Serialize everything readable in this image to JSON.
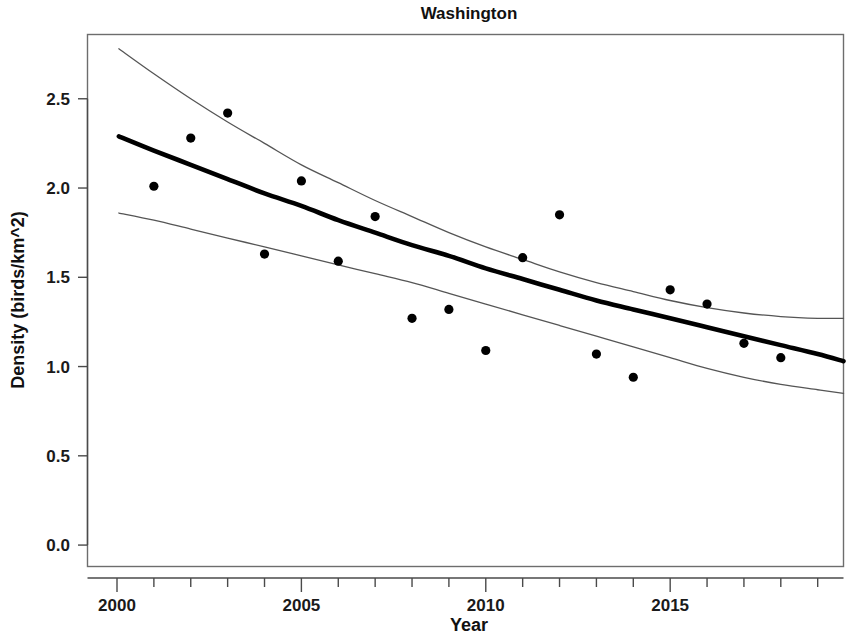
{
  "chart_data": {
    "type": "scatter",
    "title": "Washington",
    "xlabel": "Year",
    "ylabel": "Density (birds/km^2)",
    "xlim": [
      1999.2,
      2019.7
    ],
    "ylim": [
      -0.12,
      2.86
    ],
    "grid": false,
    "legend": "none",
    "x_major_ticks": [
      2000,
      2005,
      2010,
      2015
    ],
    "x_major_tick_labels": [
      "2000",
      "2005",
      "2010",
      "2015"
    ],
    "x_minor_ticks": [
      2000,
      2001,
      2002,
      2003,
      2004,
      2005,
      2006,
      2007,
      2008,
      2009,
      2010,
      2011,
      2012,
      2013,
      2014,
      2015,
      2016,
      2017,
      2018,
      2019
    ],
    "y_ticks": [
      0.0,
      0.5,
      1.0,
      1.5,
      2.0,
      2.5
    ],
    "y_tick_labels": [
      "0.0",
      "0.5",
      "1.0",
      "1.5",
      "2.0",
      "2.5"
    ],
    "x": [
      2001,
      2002,
      2003,
      2004,
      2005,
      2006,
      2007,
      2008,
      2009,
      2010,
      2011,
      2012,
      2013,
      2014,
      2015,
      2016,
      2017,
      2018
    ],
    "values": [
      2.01,
      2.28,
      2.42,
      1.63,
      2.04,
      1.59,
      1.84,
      1.27,
      1.32,
      1.09,
      1.61,
      1.85,
      1.07,
      0.94,
      1.43,
      1.35,
      1.13,
      1.05
    ],
    "series": [
      {
        "name": "observed density",
        "type": "scatter",
        "marker": "filled-circle",
        "color": "#000000",
        "x": [
          2001,
          2002,
          2003,
          2004,
          2005,
          2006,
          2007,
          2008,
          2009,
          2010,
          2011,
          2012,
          2013,
          2014,
          2015,
          2016,
          2017,
          2018
        ],
        "values": [
          2.01,
          2.28,
          2.42,
          1.63,
          2.04,
          1.59,
          1.84,
          1.27,
          1.32,
          1.09,
          1.61,
          1.85,
          1.07,
          0.94,
          1.43,
          1.35,
          1.13,
          1.05
        ]
      },
      {
        "name": "fitted trend",
        "type": "line",
        "color": "#000000",
        "x": [
          2000.05,
          2001,
          2002,
          2003,
          2004,
          2005,
          2006,
          2007,
          2008,
          2009,
          2010,
          2011,
          2012,
          2013,
          2014,
          2015,
          2016,
          2017,
          2018,
          2019,
          2019.7
        ],
        "values": [
          2.29,
          2.21,
          2.13,
          2.05,
          1.97,
          1.9,
          1.82,
          1.75,
          1.68,
          1.62,
          1.55,
          1.49,
          1.43,
          1.37,
          1.32,
          1.27,
          1.22,
          1.17,
          1.12,
          1.07,
          1.03
        ]
      },
      {
        "name": "upper confidence limit",
        "type": "line",
        "color": "#555555",
        "x": [
          2000.05,
          2001,
          2002,
          2003,
          2004,
          2005,
          2006,
          2007,
          2008,
          2009,
          2010,
          2011,
          2012,
          2013,
          2014,
          2015,
          2016,
          2017,
          2018,
          2019,
          2019.7
        ],
        "values": [
          2.78,
          2.64,
          2.5,
          2.37,
          2.25,
          2.13,
          2.03,
          1.93,
          1.84,
          1.75,
          1.67,
          1.6,
          1.53,
          1.47,
          1.42,
          1.37,
          1.33,
          1.3,
          1.28,
          1.27,
          1.27
        ]
      },
      {
        "name": "lower confidence limit",
        "type": "line",
        "color": "#555555",
        "x": [
          2000.05,
          2001,
          2002,
          2003,
          2004,
          2005,
          2006,
          2007,
          2008,
          2009,
          2010,
          2011,
          2012,
          2013,
          2014,
          2015,
          2016,
          2017,
          2018,
          2019,
          2019.7
        ],
        "values": [
          1.86,
          1.82,
          1.77,
          1.72,
          1.67,
          1.62,
          1.57,
          1.52,
          1.47,
          1.41,
          1.35,
          1.29,
          1.23,
          1.17,
          1.11,
          1.05,
          0.99,
          0.94,
          0.9,
          0.87,
          0.85
        ]
      }
    ],
    "annotations": []
  },
  "figure": {
    "title": "Washington",
    "x_axis_title": "Year",
    "y_axis_title": "Density (birds/km^2)",
    "accent_color": "#000000",
    "ci_color": "#555555",
    "frame_color": "#6d6d6d",
    "background": "#ffffff"
  }
}
